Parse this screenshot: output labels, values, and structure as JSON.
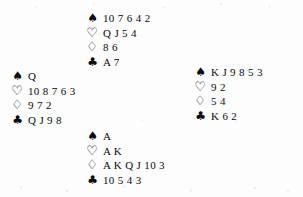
{
  "diagram": {
    "type": "bridge-deal",
    "background_color": "#fdfdfd",
    "ink_color": "#0b0b0b",
    "suit_glyphs": {
      "spades": "♠",
      "hearts": "♡",
      "diamonds": "♢",
      "clubs": "♣"
    },
    "suit_order": [
      "spades",
      "hearts",
      "diamonds",
      "clubs"
    ],
    "hands": {
      "north": {
        "position": "north",
        "spades": "10 7 6 4 2",
        "hearts": "Q J 5 4",
        "diamonds": "8 6",
        "clubs": "A 7"
      },
      "west": {
        "position": "west",
        "spades": "Q",
        "hearts": "10 8 7 6 3",
        "diamonds": "9 7 2",
        "clubs": "Q J 9 8"
      },
      "east": {
        "position": "east",
        "spades": "K J 9 8 5 3",
        "hearts": "9 2",
        "diamonds": "5 4",
        "clubs": "K 6 2"
      },
      "south": {
        "position": "south",
        "spades": "A",
        "hearts": "A K",
        "diamonds": "A K Q J 10 3",
        "clubs": "10 5 4 3"
      }
    }
  }
}
